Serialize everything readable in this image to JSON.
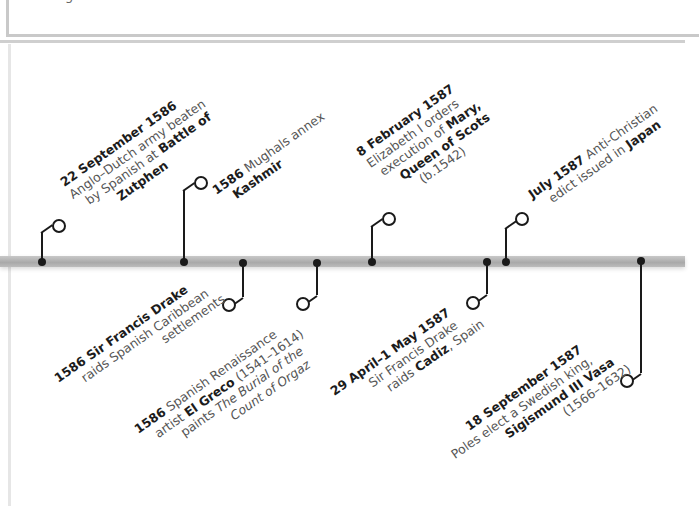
{
  "header": {
    "fragment": "g                            ."
  },
  "timeline": {
    "axis_color": "#b0b0b0",
    "events_above": [
      {
        "id": "zutphen",
        "date": "22 September 1586",
        "lines": [
          "Anglo-Dutch army beaten",
          "by Spanish at Battle of",
          "Zutphen"
        ],
        "bold_terms": [
          "Battle of",
          "Zutphen"
        ]
      },
      {
        "id": "kashmir",
        "date": "1586",
        "lines": [
          "Mughals annex",
          "Kashmir"
        ],
        "bold_terms": [
          "Kashmir"
        ]
      },
      {
        "id": "mary",
        "date": "8 February 1587",
        "lines": [
          "Elizabeth I orders",
          "execution of Mary,",
          "Queen of Scots",
          "(b.1542)"
        ],
        "bold_terms": [
          "Mary,",
          "Queen of Scots"
        ]
      },
      {
        "id": "japan",
        "date": "July 1587",
        "lines": [
          "Anti-Christian",
          "edict issued in Japan"
        ],
        "bold_terms": [
          "Japan"
        ]
      }
    ],
    "events_below": [
      {
        "id": "drake-caribbean",
        "date": "1586",
        "lines": [
          "Sir Francis Drake",
          "raids Spanish Caribbean",
          "settlements"
        ],
        "bold_terms": [
          "Sir Francis Drake"
        ]
      },
      {
        "id": "el-greco",
        "date": "1586",
        "lines": [
          "Spanish Renaissance",
          "artist El Greco (1541-1614)",
          "paints The Burial of the",
          "Count of Orgaz"
        ],
        "bold_terms": [
          "El Greco"
        ],
        "italic_terms": [
          "The Burial of the",
          "Count of Orgaz"
        ]
      },
      {
        "id": "cadiz",
        "date": "29 April-1 May 1587",
        "lines": [
          "Sir Francis Drake",
          "raids Cadiz, Spain"
        ],
        "bold_terms": [
          "Cadiz"
        ]
      },
      {
        "id": "sigismund",
        "date": "18 September 1587",
        "lines": [
          "Poles elect a Swedish king,",
          "Sigismund III Vasa",
          "(1566-1632)"
        ],
        "bold_terms": [
          "Sigismund III Vasa"
        ]
      }
    ]
  },
  "text": {
    "zutphen_date": "22 September 1586",
    "zutphen_l1": "Anglo–Dutch army beaten",
    "zutphen_l2a": "by Spanish at ",
    "zutphen_l2b": "Battle of",
    "zutphen_l3": "Zutphen",
    "kashmir_date": "1586",
    "kashmir_l1": " Mughals annex",
    "kashmir_l2": "Kashmir",
    "mary_date": "8 February 1587",
    "mary_l1": "Elizabeth I orders",
    "mary_l2a": "execution of ",
    "mary_l2b": "Mary,",
    "mary_l3": "Queen of Scots",
    "mary_l4": "(b.1542)",
    "japan_date": "July 1587",
    "japan_l1": " Anti-Christian",
    "japan_l2a": "edict issued in ",
    "japan_l2b": "Japan",
    "drake_date": "1586 Sir Francis Drake",
    "drake_l1": "raids Spanish Caribbean",
    "drake_l2": "settlements",
    "greco_date": "1586",
    "greco_l1": " Spanish Renaissance",
    "greco_l2a": "artist ",
    "greco_l2b": "El Greco",
    "greco_l2c": " (1541–1614)",
    "greco_l3a": "paints ",
    "greco_l3b": "The Burial of the",
    "greco_l4": "Count of Orgaz",
    "cadiz_date": "29 April–1 May 1587",
    "cadiz_l1": "Sir Francis Drake",
    "cadiz_l2a": "raids ",
    "cadiz_l2b": "Cadiz",
    "cadiz_l2c": ", Spain",
    "sig_date": "18 September 1587",
    "sig_l1": "Poles elect a Swedish king,",
    "sig_l2": "Sigismund III Vasa",
    "sig_l3": "(1566–1632)"
  }
}
